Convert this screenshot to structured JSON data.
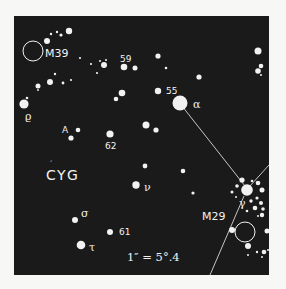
{
  "map": {
    "constellation_label": "CYG",
    "scale_label": "1″ = 5°.4",
    "colors": {
      "page_background": "#f7f7f5",
      "sky_background": "#1a1a1a",
      "star": "#f2f2f2",
      "line": "#d8d8d8"
    },
    "frame": {
      "x": 14,
      "y": 16,
      "width": 255,
      "height": 259
    },
    "clusters": [
      {
        "id": "M39",
        "label": "M39",
        "cx": 33,
        "cy": 51,
        "r": 10,
        "label_x": 45,
        "label_y": 57
      },
      {
        "id": "M29",
        "label": "M29",
        "cx": 245,
        "cy": 232,
        "r": 10,
        "label_x": 202,
        "label_y": 220
      }
    ],
    "labeled_stars": [
      {
        "name": "alpha",
        "label": "α",
        "cx": 180,
        "cy": 103,
        "r": 7.5,
        "label_x": 193,
        "label_y": 108
      },
      {
        "name": "55",
        "label": "55",
        "cx": 158,
        "cy": 91,
        "r": 3.2,
        "label_x": 166,
        "label_y": 94
      },
      {
        "name": "59",
        "label": "59",
        "cx": 124,
        "cy": 67,
        "r": 3.3,
        "label_x": 120,
        "label_y": 62
      },
      {
        "name": "62",
        "label": "62",
        "cx": 110,
        "cy": 134,
        "r": 3.6,
        "label_x": 105,
        "label_y": 149
      },
      {
        "name": "A",
        "label": "A",
        "cx": 71,
        "cy": 138,
        "r": 2.6,
        "label_x": 62,
        "label_y": 133
      },
      {
        "name": "rho",
        "label": "ϱ",
        "cx": 24,
        "cy": 104,
        "r": 4.6,
        "label_x": 25,
        "label_y": 120
      },
      {
        "name": "nu",
        "label": "ν",
        "cx": 136,
        "cy": 185,
        "r": 3.7,
        "label_x": 144,
        "label_y": 191
      },
      {
        "name": "sigma",
        "label": "σ",
        "cx": 75,
        "cy": 220,
        "r": 3,
        "label_x": 81,
        "label_y": 217
      },
      {
        "name": "61",
        "label": "61",
        "cx": 110,
        "cy": 232,
        "r": 3,
        "label_x": 119,
        "label_y": 235
      },
      {
        "name": "tau",
        "label": "τ",
        "cx": 81,
        "cy": 245,
        "r": 4.3,
        "label_x": 89,
        "label_y": 251
      },
      {
        "name": "gamma",
        "label": "γ",
        "cx": 247,
        "cy": 190,
        "r": 5.8,
        "label_x": 239,
        "label_y": 207
      }
    ],
    "stars": [
      {
        "cx": 69,
        "cy": 31,
        "r": 3.2
      },
      {
        "cx": 61,
        "cy": 35,
        "r": 1.6
      },
      {
        "cx": 57,
        "cy": 32,
        "r": 1.2
      },
      {
        "cx": 51,
        "cy": 34,
        "r": 1.2
      },
      {
        "cx": 47,
        "cy": 41,
        "r": 3
      },
      {
        "cx": 80,
        "cy": 58,
        "r": 1.1
      },
      {
        "cx": 91,
        "cy": 64,
        "r": 1.1
      },
      {
        "cx": 100,
        "cy": 61,
        "r": 1
      },
      {
        "cx": 106,
        "cy": 60,
        "r": 1
      },
      {
        "cx": 104,
        "cy": 65,
        "r": 3
      },
      {
        "cx": 97,
        "cy": 73,
        "r": 1.1
      },
      {
        "cx": 135,
        "cy": 68,
        "r": 2.5
      },
      {
        "cx": 55,
        "cy": 74,
        "r": 1.2
      },
      {
        "cx": 50,
        "cy": 82,
        "r": 3
      },
      {
        "cx": 63,
        "cy": 83,
        "r": 1.4
      },
      {
        "cx": 71,
        "cy": 80,
        "r": 1.1
      },
      {
        "cx": 38,
        "cy": 86,
        "r": 2.5
      },
      {
        "cx": 38,
        "cy": 90,
        "r": 0.9
      },
      {
        "cx": 27,
        "cy": 98,
        "r": 1.3
      },
      {
        "cx": 122,
        "cy": 93,
        "r": 3.3
      },
      {
        "cx": 116,
        "cy": 99,
        "r": 2.3
      },
      {
        "cx": 158,
        "cy": 56,
        "r": 2.6
      },
      {
        "cx": 166,
        "cy": 68,
        "r": 1.3
      },
      {
        "cx": 199,
        "cy": 77,
        "r": 2.6
      },
      {
        "cx": 258,
        "cy": 51,
        "r": 3.5
      },
      {
        "cx": 258,
        "cy": 71,
        "r": 2.8
      },
      {
        "cx": 261,
        "cy": 66,
        "r": 2.3
      },
      {
        "cx": 261,
        "cy": 75,
        "r": 1
      },
      {
        "cx": 78,
        "cy": 130,
        "r": 2.3
      },
      {
        "cx": 146,
        "cy": 125,
        "r": 3.5
      },
      {
        "cx": 156,
        "cy": 130,
        "r": 2.6
      },
      {
        "cx": 145,
        "cy": 166,
        "r": 2.4
      },
      {
        "cx": 183,
        "cy": 171,
        "r": 2.3
      },
      {
        "cx": 193,
        "cy": 193,
        "r": 1.6
      },
      {
        "cx": 242,
        "cy": 180,
        "r": 2.6
      },
      {
        "cx": 237,
        "cy": 186,
        "r": 1.8
      },
      {
        "cx": 252,
        "cy": 181,
        "r": 1.3
      },
      {
        "cx": 258,
        "cy": 183,
        "r": 2.3
      },
      {
        "cx": 262,
        "cy": 190,
        "r": 2.5
      },
      {
        "cx": 232,
        "cy": 192,
        "r": 1.5
      },
      {
        "cx": 236,
        "cy": 197,
        "r": 1
      },
      {
        "cx": 257,
        "cy": 198,
        "r": 1.6
      },
      {
        "cx": 251,
        "cy": 201,
        "r": 1.7
      },
      {
        "cx": 261,
        "cy": 203,
        "r": 2
      },
      {
        "cx": 263,
        "cy": 209,
        "r": 1.8
      },
      {
        "cx": 255,
        "cy": 208,
        "r": 2.3
      },
      {
        "cx": 247,
        "cy": 211,
        "r": 1.3
      },
      {
        "cx": 262,
        "cy": 215,
        "r": 2.2
      },
      {
        "cx": 258,
        "cy": 216,
        "r": 1
      },
      {
        "cx": 232,
        "cy": 230,
        "r": 3
      },
      {
        "cx": 267,
        "cy": 231,
        "r": 2.5
      },
      {
        "cx": 248,
        "cy": 246,
        "r": 3
      },
      {
        "cx": 257,
        "cy": 252,
        "r": 1.2
      },
      {
        "cx": 264,
        "cy": 252,
        "r": 2.3
      },
      {
        "cx": 268,
        "cy": 250,
        "r": 1
      },
      {
        "cx": 248,
        "cy": 255,
        "r": 1
      },
      {
        "cx": 262,
        "cy": 257,
        "r": 1
      }
    ],
    "lines": [
      {
        "x1": 182,
        "y1": 106,
        "x2": 245,
        "y2": 186
      },
      {
        "x1": 250,
        "y1": 186,
        "x2": 269,
        "y2": 165
      },
      {
        "x1": 244,
        "y1": 196,
        "x2": 210,
        "y2": 275
      }
    ]
  }
}
